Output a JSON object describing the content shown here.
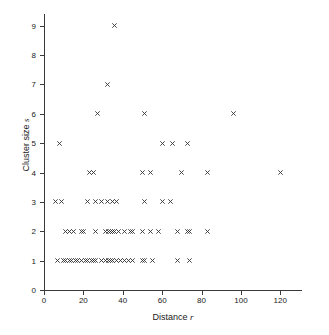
{
  "chart_data": {
    "type": "scatter",
    "title": "",
    "xlabel": "Distance r",
    "ylabel": "Cluster size s",
    "xlabel_text": "Distance",
    "xlabel_var": "r",
    "ylabel_text": "Cluster size",
    "ylabel_var": "s",
    "marker": "x",
    "marker_color": "#333333",
    "grid": false,
    "legend": null,
    "xlim": [
      0,
      130
    ],
    "ylim": [
      0,
      9.4
    ],
    "xticks": [
      0,
      20,
      40,
      60,
      80,
      100,
      120
    ],
    "yticks": [
      0,
      1,
      2,
      3,
      4,
      5,
      6,
      7,
      8,
      9
    ],
    "xticklabels": [
      "0",
      "20",
      "40",
      "60",
      "80",
      "100",
      "120"
    ],
    "yticklabels": [
      "0",
      "1",
      "2",
      "3",
      "4",
      "5",
      "6",
      "7",
      "8",
      "9"
    ],
    "points": [
      {
        "x": 36,
        "y": 9
      },
      {
        "x": 32,
        "y": 7
      },
      {
        "x": 27,
        "y": 6
      },
      {
        "x": 51,
        "y": 6
      },
      {
        "x": 96,
        "y": 6
      },
      {
        "x": 8,
        "y": 5
      },
      {
        "x": 60,
        "y": 5
      },
      {
        "x": 65,
        "y": 5
      },
      {
        "x": 73,
        "y": 5
      },
      {
        "x": 23,
        "y": 4
      },
      {
        "x": 25,
        "y": 4
      },
      {
        "x": 50,
        "y": 4
      },
      {
        "x": 54,
        "y": 4
      },
      {
        "x": 70,
        "y": 4
      },
      {
        "x": 83,
        "y": 4
      },
      {
        "x": 120,
        "y": 4
      },
      {
        "x": 6,
        "y": 3
      },
      {
        "x": 9,
        "y": 3
      },
      {
        "x": 22,
        "y": 3
      },
      {
        "x": 26,
        "y": 3
      },
      {
        "x": 29,
        "y": 3
      },
      {
        "x": 32,
        "y": 3
      },
      {
        "x": 35,
        "y": 3
      },
      {
        "x": 37,
        "y": 3
      },
      {
        "x": 51,
        "y": 3
      },
      {
        "x": 60,
        "y": 3
      },
      {
        "x": 64,
        "y": 3
      },
      {
        "x": 11,
        "y": 2
      },
      {
        "x": 13,
        "y": 2
      },
      {
        "x": 15,
        "y": 2
      },
      {
        "x": 19,
        "y": 2
      },
      {
        "x": 20,
        "y": 2
      },
      {
        "x": 26,
        "y": 2
      },
      {
        "x": 31,
        "y": 2
      },
      {
        "x": 33,
        "y": 2
      },
      {
        "x": 34,
        "y": 2
      },
      {
        "x": 35,
        "y": 2
      },
      {
        "x": 36,
        "y": 2
      },
      {
        "x": 38,
        "y": 2
      },
      {
        "x": 41,
        "y": 2
      },
      {
        "x": 44,
        "y": 2
      },
      {
        "x": 45,
        "y": 2
      },
      {
        "x": 50,
        "y": 2
      },
      {
        "x": 54,
        "y": 2
      },
      {
        "x": 58,
        "y": 2
      },
      {
        "x": 68,
        "y": 2
      },
      {
        "x": 73,
        "y": 2
      },
      {
        "x": 74,
        "y": 2
      },
      {
        "x": 83,
        "y": 2
      },
      {
        "x": 7,
        "y": 1
      },
      {
        "x": 10,
        "y": 1
      },
      {
        "x": 11,
        "y": 1
      },
      {
        "x": 13,
        "y": 1
      },
      {
        "x": 14,
        "y": 1
      },
      {
        "x": 16,
        "y": 1
      },
      {
        "x": 17,
        "y": 1
      },
      {
        "x": 19,
        "y": 1
      },
      {
        "x": 21,
        "y": 1
      },
      {
        "x": 22,
        "y": 1
      },
      {
        "x": 24,
        "y": 1
      },
      {
        "x": 25,
        "y": 1
      },
      {
        "x": 26,
        "y": 1
      },
      {
        "x": 29,
        "y": 1
      },
      {
        "x": 31,
        "y": 1
      },
      {
        "x": 33,
        "y": 1
      },
      {
        "x": 34,
        "y": 1
      },
      {
        "x": 35,
        "y": 1
      },
      {
        "x": 37,
        "y": 1
      },
      {
        "x": 39,
        "y": 1
      },
      {
        "x": 41,
        "y": 1
      },
      {
        "x": 43,
        "y": 1
      },
      {
        "x": 45,
        "y": 1
      },
      {
        "x": 50,
        "y": 1
      },
      {
        "x": 51,
        "y": 1
      },
      {
        "x": 55,
        "y": 1
      },
      {
        "x": 68,
        "y": 1
      },
      {
        "x": 74,
        "y": 1
      }
    ]
  }
}
